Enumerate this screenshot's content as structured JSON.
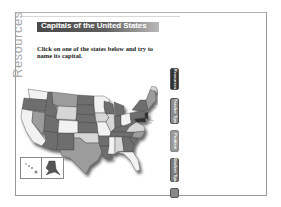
{
  "sidebar": {
    "label": "Resources"
  },
  "header": {
    "title": "Capitals of the United States"
  },
  "main": {
    "instructions": "Click on one of the states below and try to name its capital."
  },
  "tabs": [
    {
      "label": "Resources",
      "active": true
    },
    {
      "label": "Teacher Tips",
      "active": false
    },
    {
      "label": "Problem",
      "active": false
    },
    {
      "label": "Student Tips",
      "active": false
    },
    {
      "label": "",
      "active": false
    }
  ],
  "map": {
    "description": "Clickable map of the United States",
    "inset_labels": [
      "Hawaii",
      "Alaska"
    ]
  },
  "colors": {
    "title_bar_dark": "#4a4a4a",
    "title_bar_light": "#b9b9b9",
    "state_dark": "#6e6e6e",
    "state_mid": "#9c9c9c",
    "state_light": "#d6d6d6",
    "state_white": "#f2f2f2"
  }
}
